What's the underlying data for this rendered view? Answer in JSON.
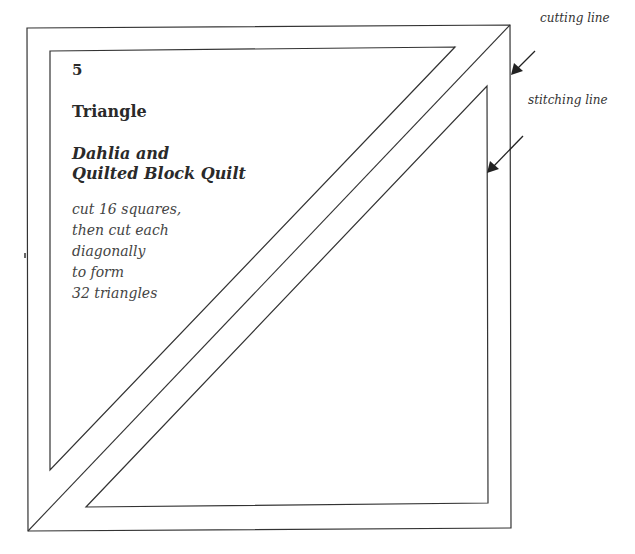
{
  "template": {
    "number": "5",
    "shape": "Triangle",
    "quilt_name_lines": [
      "Dahlia and",
      "Quilted Block Quilt"
    ],
    "instructions": [
      "cut 16 squares,",
      "then cut each",
      "diagonally",
      "to form",
      "32 triangles"
    ]
  },
  "labels": {
    "cutting_line": "cutting line",
    "stitching_line": "stitching line"
  },
  "colors": {
    "line": "#333333",
    "background": "#ffffff"
  }
}
